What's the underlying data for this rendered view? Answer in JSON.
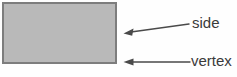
{
  "diagram": {
    "type": "geometry-rectangle-annotation",
    "background_color": "#fefefe",
    "shape": {
      "name": "rectangle",
      "fill_color": "#b9b9b9",
      "stroke_color": "#7d7d7d",
      "stroke_width": 2,
      "x": 2,
      "y": 2,
      "width": 115,
      "height": 62
    },
    "annotations": [
      {
        "id": "side",
        "label": "side",
        "arrow": {
          "color": "#4a4a4a",
          "tail_x": 189,
          "tail_y": 24,
          "tip_x": 124,
          "tip_y": 33,
          "orientation": "slanted-left"
        },
        "label_x": 192,
        "label_y": 15
      },
      {
        "id": "vertex",
        "label": "vertex",
        "arrow": {
          "color": "#4a4a4a",
          "tail_x": 190,
          "tail_y": 62,
          "tip_x": 124,
          "tip_y": 62,
          "orientation": "horizontal-left"
        },
        "label_x": 191,
        "label_y": 53
      }
    ]
  }
}
